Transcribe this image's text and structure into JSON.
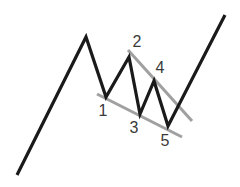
{
  "diagram": {
    "title": "",
    "colors": {
      "price_line": "#1a1a1a",
      "trend_lines": "#a0a0a0",
      "labels": "#3a3a3a",
      "background": "#ffffff"
    },
    "price_path": [
      [
        17,
        175
      ],
      [
        86,
        37
      ],
      [
        106,
        97
      ],
      [
        129,
        57
      ],
      [
        140,
        114
      ],
      [
        154,
        81
      ],
      [
        168,
        126
      ],
      [
        225,
        15
      ]
    ],
    "upper_trendline": [
      [
        128,
        50
      ],
      [
        192,
        121
      ]
    ],
    "lower_trendline": [
      [
        97,
        94
      ],
      [
        182,
        137
      ]
    ],
    "labels": [
      {
        "text": "1",
        "x": 103,
        "y": 111
      },
      {
        "text": "2",
        "x": 137,
        "y": 42
      },
      {
        "text": "3",
        "x": 134,
        "y": 128
      },
      {
        "text": "4",
        "x": 160,
        "y": 68
      },
      {
        "text": "5",
        "x": 165,
        "y": 141
      }
    ]
  }
}
